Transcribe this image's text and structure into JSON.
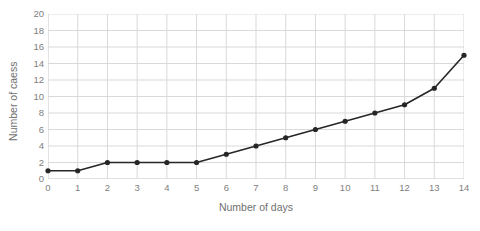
{
  "chart_data": {
    "type": "line",
    "title": "",
    "xlabel": "Number of days",
    "ylabel": "Number of caess",
    "x": [
      0,
      1,
      2,
      3,
      4,
      5,
      6,
      7,
      8,
      9,
      10,
      11,
      12,
      13,
      14
    ],
    "values": [
      1,
      1,
      2,
      2,
      2,
      2,
      3,
      4,
      5,
      6,
      7,
      8,
      9,
      11,
      15
    ],
    "series": [
      {
        "name": "",
        "values": [
          1,
          1,
          2,
          2,
          2,
          2,
          3,
          4,
          5,
          6,
          7,
          8,
          9,
          11,
          15
        ]
      }
    ],
    "xlim": [
      0,
      14
    ],
    "ylim": [
      0,
      20
    ],
    "xticks": [
      "0",
      "1",
      "2",
      "3",
      "4",
      "5",
      "6",
      "7",
      "8",
      "9",
      "10",
      "11",
      "12",
      "13",
      "14"
    ],
    "yticks": [
      "0",
      "2",
      "4",
      "6",
      "8",
      "10",
      "12",
      "14",
      "16",
      "18",
      "20"
    ],
    "grid": true,
    "legend": false,
    "legend_position": "none",
    "marker": "circle",
    "colors": {
      "line": "#262626",
      "marker": "#262626",
      "grid": "#d9d9d9",
      "axis": "#d9d9d9",
      "tick_label": "#808080",
      "axis_title": "#707070",
      "background": "#ffffff"
    }
  }
}
